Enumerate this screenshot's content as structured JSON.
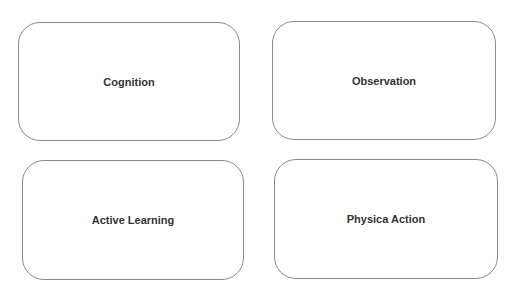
{
  "diagram": {
    "boxes": [
      {
        "label": "Cognition"
      },
      {
        "label": "Observation"
      },
      {
        "label": "Active Learning"
      },
      {
        "label": "Physica Action"
      }
    ],
    "colors": {
      "border": "#8a8a8a",
      "text": "#333333",
      "background": "#ffffff"
    }
  }
}
